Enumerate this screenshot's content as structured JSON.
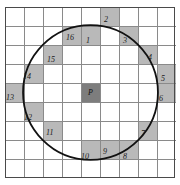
{
  "figure": {
    "type": "raster-circle-grid",
    "center_label": "P",
    "grid": {
      "columns": 9,
      "rows": 9,
      "cell_size": 19
    },
    "colors": {
      "background": "#ffffff",
      "grid_line": "#8a8a8a",
      "frame": "#4a4a4a",
      "shaded_cell": "#b9b9b9",
      "center_cell": "#7d7d7d",
      "circle_stroke": "#111111",
      "label_text": "#1a1a1a"
    },
    "circle": {
      "center_col": 4,
      "center_row": 4,
      "radius_cells": 3.55,
      "stroke_width": 1.8
    }
  },
  "center": {
    "col": 4,
    "row": 4,
    "label": "P"
  },
  "pixels": [
    {
      "label": "1",
      "col": 4,
      "row": 1,
      "tx": 5,
      "ty": 11
    },
    {
      "label": "2",
      "col": 5,
      "row": 0,
      "tx": 4,
      "ty": 9
    },
    {
      "label": "3",
      "col": 6,
      "row": 1,
      "tx": 4,
      "ty": 11
    },
    {
      "label": "4",
      "col": 7,
      "row": 2,
      "tx": 10,
      "ty": 9
    },
    {
      "label": "5",
      "col": 8,
      "row": 3,
      "tx": 4,
      "ty": 11
    },
    {
      "label": "6",
      "col": 8,
      "row": 4,
      "tx": 2,
      "ty": 12
    },
    {
      "label": "7",
      "col": 7,
      "row": 6,
      "tx": 3,
      "ty": 9
    },
    {
      "label": "8",
      "col": 6,
      "row": 7,
      "tx": 4,
      "ty": 13
    },
    {
      "label": "9",
      "col": 5,
      "row": 7,
      "tx": 3,
      "ty": 8
    },
    {
      "label": "10",
      "col": 4,
      "row": 7,
      "tx": 0,
      "ty": 13
    },
    {
      "label": "11",
      "col": 2,
      "row": 6,
      "tx": 3,
      "ty": 8
    },
    {
      "label": "12",
      "col": 1,
      "row": 5,
      "tx": 0,
      "ty": 12
    },
    {
      "label": "13",
      "col": 0,
      "row": 4,
      "tx": 1,
      "ty": 11
    },
    {
      "label": "14",
      "col": 1,
      "row": 3,
      "tx": -1,
      "ty": 9
    },
    {
      "label": "15",
      "col": 2,
      "row": 2,
      "tx": 4,
      "ty": 11
    },
    {
      "label": "16",
      "col": 3,
      "row": 1,
      "tx": 4,
      "ty": 8
    }
  ]
}
